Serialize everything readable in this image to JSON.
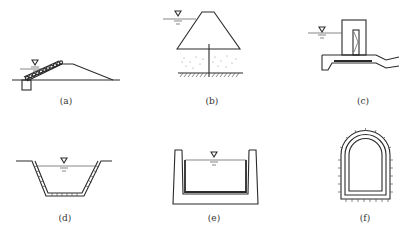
{
  "figure": {
    "panels": [
      {
        "id": "a",
        "label": "(a)",
        "description": "Earth dam with riprap-lined upstream slope and toe trench"
      },
      {
        "id": "b",
        "label": "(b)",
        "description": "Dam on permeable foundation with cutoff wall"
      },
      {
        "id": "c",
        "label": "(c)",
        "description": "Intake tower with gate and outlet conduit"
      },
      {
        "id": "d",
        "label": "(d)",
        "description": "Lined trapezoidal canal"
      },
      {
        "id": "e",
        "label": "(e)",
        "description": "Lined rectangular flume/channel"
      },
      {
        "id": "f",
        "label": "(f)",
        "description": "Lined arched tunnel section"
      }
    ],
    "symbols": {
      "water_level": "▽"
    },
    "colors": {
      "line": "#2a2a2a",
      "background": "#ffffff"
    }
  }
}
